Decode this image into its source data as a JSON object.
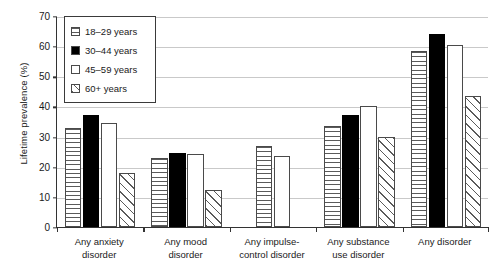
{
  "chart_data": {
    "type": "bar",
    "title": "",
    "subtitle": "",
    "xlabel": "",
    "ylabel": "Lifetime prevalence (%)",
    "ylim": [
      0,
      70
    ],
    "ytick_values": [
      0,
      10,
      20,
      30,
      40,
      50,
      60,
      70
    ],
    "ytick_labels": [
      "0",
      "10",
      "20",
      "30",
      "40",
      "50",
      "60",
      "70"
    ],
    "grid": "horizontal",
    "legend_position": "top-left-inside",
    "categories": [
      "Any anxiety disorder",
      "Any mood disorder",
      "Any impulse-control disorder",
      "Any substance use disorder",
      "Any disorder"
    ],
    "category_lines": [
      [
        "Any anxiety",
        "disorder"
      ],
      [
        "Any mood",
        "disorder"
      ],
      [
        "Any impulse-",
        "control disorder"
      ],
      [
        "Any substance",
        "use disorder"
      ],
      [
        "Any disorder"
      ]
    ],
    "series": [
      {
        "name": "18–29 years",
        "pattern": "horizontal-lines",
        "values": [
          32.8,
          22.9,
          27.0,
          33.5,
          58.5
        ]
      },
      {
        "name": "30–44 years",
        "pattern": "solid-black",
        "values": [
          37.0,
          24.6,
          null,
          37.2,
          64.0
        ]
      },
      {
        "name": "45–59 years",
        "pattern": "empty-white",
        "values": [
          34.5,
          24.3,
          23.4,
          40.0,
          60.5
        ]
      },
      {
        "name": "60+ years",
        "pattern": "diagonal-hatch",
        "values": [
          18.0,
          12.3,
          null,
          30.0,
          43.5
        ]
      }
    ]
  },
  "legend": {
    "items": [
      {
        "label": "18–29 years",
        "pattern": "horizontal-lines"
      },
      {
        "label": "30–44 years",
        "pattern": "solid-black"
      },
      {
        "label": "45–59 years",
        "pattern": "empty-white"
      },
      {
        "label": "60+ years",
        "pattern": "diagonal-hatch"
      }
    ]
  },
  "colors": {
    "axis": "#333333",
    "grid": "#c9c9c9",
    "bar_outline": "#4a4a4a",
    "solid_fill": "#000000",
    "background": "#ffffff"
  }
}
